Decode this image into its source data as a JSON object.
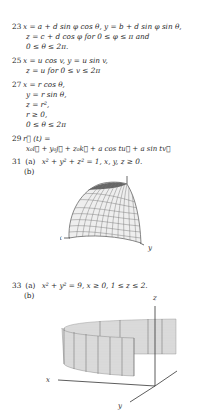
{
  "answers": [
    {
      "number": "23",
      "lines": [
        "x = a + d sin φ cos θ, y = b + d sin φ sin θ,",
        "z  =  c + d cos φ  for  0  ≤  φ  ≤  π  and",
        "0 ≤ θ ≤ 2π."
      ]
    },
    {
      "number": "25",
      "lines": [
        "x = u cos v, y = u sin v,",
        "z = u for  0 ≤ v ≤ 2π"
      ]
    },
    {
      "number": "27",
      "lines": [
        "x = r cos θ,",
        "y = r sin θ,",
        "z = r²,",
        "r ≥ 0,",
        "0 ≤ θ ≤ 2π"
      ]
    },
    {
      "number": "29",
      "lines": [
        "r⃗ (t) =",
        "x₀i⃗  + y₀j⃗  + z₀k⃗  + a cos tu⃗  + a sin tv⃗"
      ]
    },
    {
      "number": "31",
      "parts": [
        {
          "label": "(a)",
          "text": "x² + y² + z² = 1, x, y, z ≥ 0."
        },
        {
          "label": "(b)",
          "text": ""
        }
      ],
      "figure": {
        "description": "octant of unit sphere",
        "axis_labels": {
          "x": "x",
          "y": "y",
          "z": "z"
        }
      }
    },
    {
      "number": "33",
      "parts": [
        {
          "label": "(a)",
          "text": "x² + y² = 9, x ≥ 0, 1 ≤ z ≤ 2."
        },
        {
          "label": "(b)",
          "text": ""
        }
      ],
      "figure": {
        "description": "half cylinder band",
        "axis_labels": {
          "x": "x",
          "y": "y",
          "z": "z"
        }
      }
    }
  ]
}
